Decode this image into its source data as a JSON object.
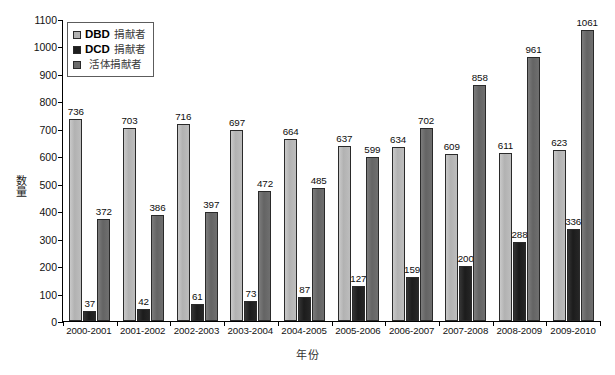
{
  "chart_data": {
    "type": "bar",
    "title": "",
    "subtitle": "",
    "xlabel": "年份",
    "ylabel": "数量",
    "ylim": [
      0,
      1100
    ],
    "ytick_step": 100,
    "yticks": [
      0,
      100,
      200,
      300,
      400,
      500,
      600,
      700,
      800,
      900,
      1000,
      1100
    ],
    "grid": false,
    "legend_position": "top-left-inside",
    "categories": [
      "2000-2001",
      "2001-2002",
      "2002-2003",
      "2003-2004",
      "2004-2005",
      "2005-2006",
      "2006-2007",
      "2007-2008",
      "2008-2009",
      "2009-2010"
    ],
    "series": [
      {
        "name": "DBD 捐献者",
        "code": "DBD",
        "cn": "捐献者",
        "color": "#b2b2b2",
        "values": [
          736,
          703,
          716,
          697,
          664,
          637,
          634,
          609,
          611,
          623
        ]
      },
      {
        "name": "DCD 捐献者",
        "code": "DCD",
        "cn": "捐献者",
        "color": "#1e1e1e",
        "values": [
          37,
          42,
          61,
          73,
          87,
          127,
          159,
          200,
          288,
          336
        ]
      },
      {
        "name": "活体捐献者",
        "code": "",
        "cn": "活体捐献者",
        "color": "#6b6b6b",
        "values": [
          372,
          386,
          397,
          472,
          485,
          599,
          702,
          858,
          961,
          1061
        ]
      }
    ]
  }
}
